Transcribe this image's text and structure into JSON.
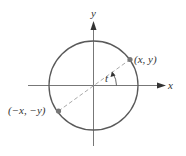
{
  "diagram": {
    "type": "unit-circle",
    "labels": {
      "x_axis": "x",
      "y_axis": "y",
      "point_pos": "(x, y)",
      "point_neg": "(−x, −y)",
      "angle": "t"
    },
    "colors": {
      "axes": "#777777",
      "circle": "#5a5a5a",
      "points": "#777777",
      "dashed": "#aaaaaa",
      "text": "#333333"
    }
  }
}
